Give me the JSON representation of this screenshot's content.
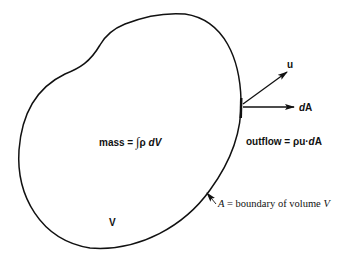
{
  "figure": {
    "type": "control-volume-diagram",
    "colors": {
      "stroke": "#111111",
      "background": "#ffffff"
    },
    "labels": {
      "u": "u",
      "dA_d": "d",
      "dA_A": "A",
      "mass_prefix": "mass",
      "mass_eq": "=",
      "mass_integral": "∫",
      "mass_rho": "ρ",
      "mass_d": "d",
      "mass_V": "V",
      "outflow_prefix": "outflow = ρ",
      "outflow_u": "u",
      "outflow_dot": "·",
      "outflow_d": "d",
      "outflow_A": "A",
      "volume": "V",
      "boundary_A": "A",
      "boundary_text": " = boundary of volume ",
      "boundary_V": "V"
    }
  }
}
